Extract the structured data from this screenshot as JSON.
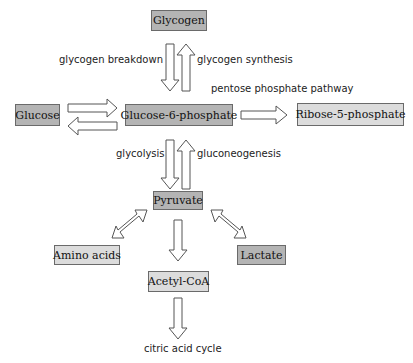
{
  "nodes": {
    "glycogen": "Glycogen",
    "glucose": "Glucose",
    "g6p": "Glucose-6-phosphate",
    "ribose": "Ribose-5-phosphate",
    "pyruvate": "Pyruvate",
    "amino_acids": "Amino acids",
    "lactate": "Lactate",
    "acetyl_coa": "Acetyl-CoA"
  },
  "labels": {
    "glycogen_breakdown": "glycogen breakdown",
    "glycogen_synthesis": "glycogen synthesis",
    "pentose_phosphate": "pentose phosphate pathway",
    "glycolysis": "glycolysis",
    "gluconeogenesis": "gluconeogenesis",
    "citric_acid_cycle": "citric acid cycle"
  },
  "colors": {
    "dark_box": "#b4b4b4",
    "light_box": "#dcdcdc",
    "border": "#6a6a6a"
  }
}
